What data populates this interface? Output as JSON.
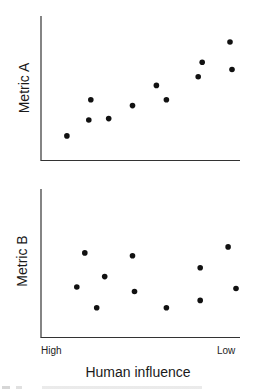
{
  "chart_data": [
    {
      "type": "scatter",
      "title": "",
      "ylabel": "Metric A",
      "xlabel": "Human influence",
      "x_tick_labels": [
        "High",
        "Low"
      ],
      "xlim": [
        0,
        100
      ],
      "ylim": [
        0,
        100
      ],
      "grid": false,
      "legend": null,
      "points": [
        {
          "x": 13,
          "y": 17
        },
        {
          "x": 24,
          "y": 28
        },
        {
          "x": 25,
          "y": 42
        },
        {
          "x": 34,
          "y": 29
        },
        {
          "x": 46,
          "y": 38
        },
        {
          "x": 58,
          "y": 52
        },
        {
          "x": 63,
          "y": 42
        },
        {
          "x": 79,
          "y": 58
        },
        {
          "x": 81,
          "y": 68
        },
        {
          "x": 95,
          "y": 82
        },
        {
          "x": 96,
          "y": 63
        }
      ]
    },
    {
      "type": "scatter",
      "title": "",
      "ylabel": "Metric B",
      "xlabel": "Human influence",
      "x_tick_labels": [
        "High",
        "Low"
      ],
      "xlim": [
        0,
        100
      ],
      "ylim": [
        0,
        100
      ],
      "grid": false,
      "legend": null,
      "points": [
        {
          "x": 18,
          "y": 34
        },
        {
          "x": 22,
          "y": 57
        },
        {
          "x": 28,
          "y": 20
        },
        {
          "x": 32,
          "y": 41
        },
        {
          "x": 46,
          "y": 55
        },
        {
          "x": 47,
          "y": 31
        },
        {
          "x": 63,
          "y": 20
        },
        {
          "x": 80,
          "y": 25
        },
        {
          "x": 80,
          "y": 47
        },
        {
          "x": 94,
          "y": 61
        },
        {
          "x": 98,
          "y": 33
        }
      ]
    }
  ],
  "panels": {
    "top": {
      "ylabel": "Metric A"
    },
    "bottom": {
      "ylabel": "Metric B"
    }
  },
  "x_axis": {
    "label": "Human influence",
    "tick_left": "High",
    "tick_right": "Low"
  },
  "colors": {
    "axis": "#333333",
    "point": "#111111",
    "background": "#ffffff"
  }
}
